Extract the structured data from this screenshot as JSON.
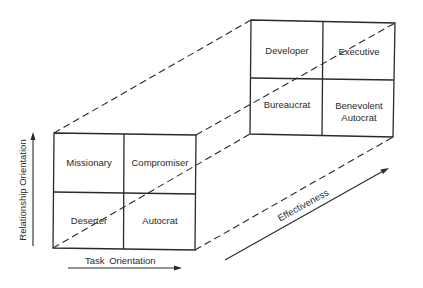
{
  "front_grid": {
    "top_left": "Missionary",
    "top_right": "Compromiser",
    "bottom_left": "Deserter",
    "bottom_right": "Autocrat"
  },
  "back_grid": {
    "top_left": "Developer",
    "top_right": "Executive",
    "bottom_left": "Bureaucrat",
    "bottom_right_line1": "Benevolent",
    "bottom_right_line2": "Autocrat"
  },
  "axes": {
    "vertical": "Relationship Orientation",
    "horizontal": "Task Orientation",
    "depth": "Effectiveness"
  },
  "colors": {
    "line": "#2a2a2a",
    "background": "#ffffff"
  }
}
